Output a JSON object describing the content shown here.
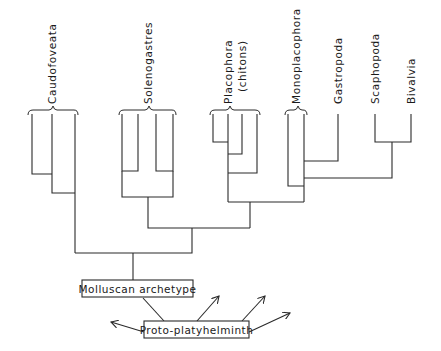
{
  "diagram": {
    "type": "cladogram",
    "taxa": [
      {
        "id": "caudofoveata",
        "label": "Caudofoveata"
      },
      {
        "id": "solenogastres",
        "label": "Solenogastres"
      },
      {
        "id": "placophora",
        "label": "Placophora",
        "sublabel": "(chitons)"
      },
      {
        "id": "monoplacophora",
        "label": "Monoplacophora"
      },
      {
        "id": "gastropoda",
        "label": "Gastropoda"
      },
      {
        "id": "scaphopoda",
        "label": "Scaphopoda"
      },
      {
        "id": "bivalvia",
        "label": "Bivalvia"
      }
    ],
    "root": {
      "label": "Molluscan archetype"
    },
    "ancestor": {
      "label": "Proto-platyhelminth"
    },
    "ancestor_arrows": 4,
    "colors": {
      "line": "#2a2a2a",
      "background": "#ffffff",
      "text": "#1a1a1a"
    }
  }
}
